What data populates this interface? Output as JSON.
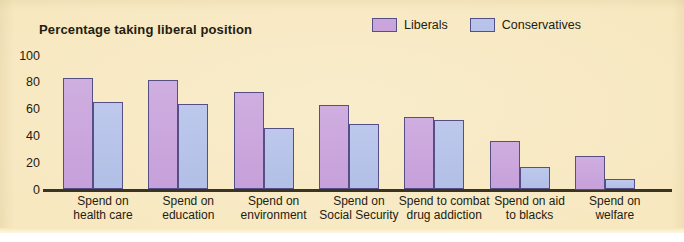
{
  "chart_data": {
    "type": "bar",
    "title": "Percentage taking liberal position",
    "xlabel": "",
    "ylabel": "",
    "ylim": [
      0,
      100
    ],
    "yticks": [
      0,
      20,
      40,
      60,
      80,
      100
    ],
    "grid": false,
    "legend_position": "top-right",
    "categories": [
      "Spend on health care",
      "Spend on education",
      "Spend on environment",
      "Spend on Social Security",
      "Spend to combat drug addiction",
      "Spend on aid to blacks",
      "Spend on welfare"
    ],
    "category_lines": [
      [
        "Spend on",
        "health care"
      ],
      [
        "Spend on",
        "education"
      ],
      [
        "Spend on",
        "environment"
      ],
      [
        "Spend on",
        "Social Security"
      ],
      [
        "Spend to combat",
        "drug addiction"
      ],
      [
        "Spend on aid",
        "to blacks"
      ],
      [
        "Spend on",
        "welfare"
      ]
    ],
    "series": [
      {
        "name": "Liberals",
        "color": "#c9a5dc",
        "values": [
          83,
          82,
          73,
          63,
          54,
          36,
          25
        ]
      },
      {
        "name": "Conservatives",
        "color": "#b7c3e9",
        "values": [
          65,
          64,
          46,
          49,
          52,
          17,
          8
        ]
      }
    ]
  },
  "colors": {
    "background": "#f7e7bd",
    "bar_border": "#564f85",
    "axis": "#3a3422",
    "text": "#241c10",
    "liberal": "#c9a5dc",
    "conservative": "#b7c3e9"
  }
}
